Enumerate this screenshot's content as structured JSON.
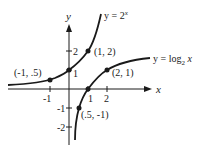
{
  "diagram": {
    "axes": {
      "x_label": "x",
      "y_label": "y",
      "x_ticks": [
        "-1",
        "1",
        "2"
      ],
      "y_ticks": [
        "1",
        "2",
        "-1",
        "-2"
      ]
    },
    "curves": [
      {
        "name": "exponential",
        "label_base": "y = 2",
        "label_sup": "x"
      },
      {
        "name": "logarithm",
        "label_base": "y = log",
        "label_sub": "2",
        "label_tail": " x"
      }
    ],
    "points": [
      {
        "label": "(1, 2)"
      },
      {
        "label": "(-1, .5)"
      },
      {
        "label": "(2, 1)"
      },
      {
        "label": "(.5, -1)"
      }
    ],
    "colors": {
      "ink": "#1a1a1a",
      "background": "#ffffff"
    }
  }
}
